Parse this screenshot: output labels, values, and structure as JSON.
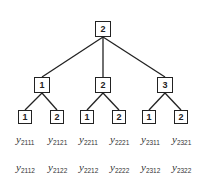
{
  "diagram": {
    "type": "tree",
    "root": {
      "label": "2"
    },
    "level1": [
      {
        "label": "1"
      },
      {
        "label": "2"
      },
      {
        "label": "3"
      }
    ],
    "level2": [
      {
        "label": "1"
      },
      {
        "label": "2"
      },
      {
        "label": "1"
      },
      {
        "label": "2"
      },
      {
        "label": "1"
      },
      {
        "label": "2"
      }
    ],
    "leaf_labels_row1": [
      {
        "var": "y",
        "sub": "2111"
      },
      {
        "var": "y",
        "sub": "2121"
      },
      {
        "var": "y",
        "sub": "2211"
      },
      {
        "var": "y",
        "sub": "2221"
      },
      {
        "var": "y",
        "sub": "2311"
      },
      {
        "var": "y",
        "sub": "2321"
      }
    ],
    "leaf_labels_row2": [
      {
        "var": "y",
        "sub": "2112"
      },
      {
        "var": "y",
        "sub": "2122"
      },
      {
        "var": "y",
        "sub": "2212"
      },
      {
        "var": "y",
        "sub": "2222"
      },
      {
        "var": "y",
        "sub": "2312"
      },
      {
        "var": "y",
        "sub": "2322"
      }
    ],
    "colors": {
      "stroke": "#222222",
      "text": "#333333",
      "background": "#ffffff"
    }
  }
}
